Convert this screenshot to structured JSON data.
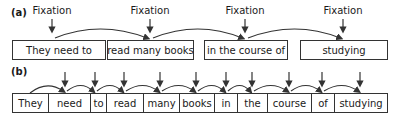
{
  "panel_a": {
    "label": "(a)",
    "fixation_label": "Fixation",
    "fixations": [
      "Fixation",
      "Fixation",
      "Fixation",
      "Fixation"
    ],
    "chunks": [
      "They need to",
      "read many books",
      "in the course of",
      "studying"
    ]
  },
  "panel_b": {
    "label": "(b)",
    "words": [
      "They",
      "need",
      "to",
      "read",
      "many",
      "books",
      "in",
      "the",
      "course",
      "of",
      "studying"
    ]
  },
  "colors": {
    "line": "#333333",
    "text": "#1a1a1a",
    "background": "#ffffff"
  }
}
